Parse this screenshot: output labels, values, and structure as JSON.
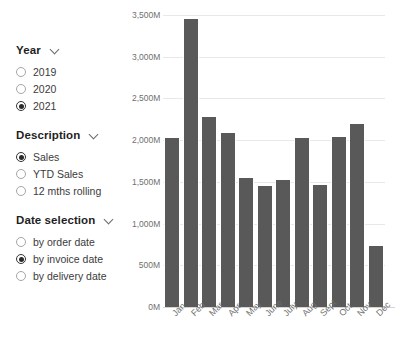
{
  "filters": {
    "groups": [
      {
        "name": "year",
        "title": "Year",
        "chevron": "chevron-down-icon",
        "options": [
          {
            "label": "2019",
            "selected": false
          },
          {
            "label": "2020",
            "selected": false
          },
          {
            "label": "2021",
            "selected": true
          }
        ]
      },
      {
        "name": "description",
        "title": "Description",
        "chevron": "chevron-down-icon",
        "options": [
          {
            "label": "Sales",
            "selected": true
          },
          {
            "label": "YTD Sales",
            "selected": false
          },
          {
            "label": "12 mths rolling",
            "selected": false
          }
        ]
      },
      {
        "name": "date-selection",
        "title": "Date selection",
        "chevron": "chevron-down-icon",
        "options": [
          {
            "label": "by order date",
            "selected": false
          },
          {
            "label": "by invoice date",
            "selected": true
          },
          {
            "label": "by delivery date",
            "selected": false
          }
        ]
      }
    ]
  },
  "caption": {
    "text": ""
  },
  "chart_data": {
    "type": "bar",
    "title": "",
    "xlabel": "",
    "ylabel": "",
    "categories": [
      "Jan",
      "Feb",
      "Mar",
      "Apr",
      "May",
      "June",
      "July",
      "Aug",
      "Sept",
      "Oct",
      "Nov",
      "Dec"
    ],
    "values": [
      2025,
      3450,
      2280,
      2085,
      1545,
      1450,
      1520,
      2025,
      1465,
      2040,
      2195,
      730
    ],
    "series": [
      {
        "name": "Sales",
        "values": [
          2025,
          3450,
          2280,
          2085,
          1545,
          1450,
          1520,
          2025,
          1465,
          2040,
          2195,
          730
        ]
      }
    ],
    "ylim": [
      0,
      3500
    ],
    "yticks": [
      0,
      500,
      1000,
      1500,
      2000,
      2500,
      3000,
      3500
    ],
    "ytick_labels": [
      "0M",
      "500M",
      "1,000M",
      "1,500M",
      "2,000M",
      "2,500M",
      "3,000M",
      "3,500M"
    ],
    "grid": true,
    "legend": false,
    "bar_color": "#595959",
    "grid_color": "#e8e8e8",
    "unit": "M"
  }
}
